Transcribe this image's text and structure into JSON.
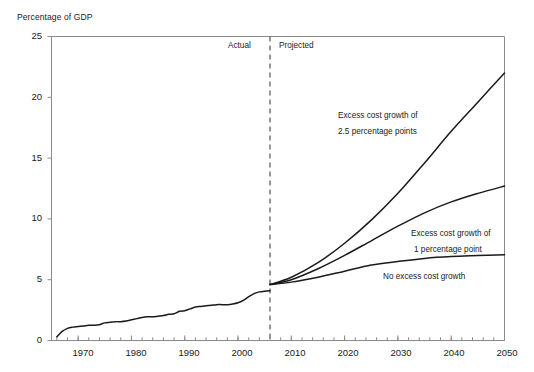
{
  "chart_data": {
    "type": "line",
    "title": "",
    "ylabel": "Percentage of GDP",
    "xlabel": "",
    "ylim": [
      0,
      25
    ],
    "xlim": [
      1965,
      2050
    ],
    "grid": false,
    "legend_position": "inline-annotations",
    "y_ticks": [
      0,
      5,
      10,
      15,
      20,
      25
    ],
    "x_ticks": [
      1970,
      1980,
      1990,
      2000,
      2010,
      2020,
      2030,
      2040,
      2050
    ],
    "x_minor_tick_step": 2,
    "divider": {
      "year": 2006,
      "style": "dashed",
      "left_label": "Actual",
      "right_label": "Projected"
    },
    "series": [
      {
        "name": "Excess cost growth of 2.5 percentage points",
        "annotation_lines": [
          "Excess cost growth of",
          "2.5 percentage points"
        ],
        "color": "#1a1a1a",
        "x": [
          2006,
          2010,
          2015,
          2020,
          2025,
          2030,
          2035,
          2040,
          2045,
          2050
        ],
        "values": [
          4.6,
          5.2,
          6.4,
          8.0,
          9.9,
          12.1,
          14.6,
          17.2,
          19.6,
          22.0
        ]
      },
      {
        "name": "Excess cost growth of 1 percentage point",
        "annotation_lines": [
          "Excess cost growth of",
          "1 percentage point"
        ],
        "color": "#1a1a1a",
        "x": [
          2006,
          2010,
          2015,
          2020,
          2025,
          2030,
          2035,
          2040,
          2045,
          2050
        ],
        "values": [
          4.6,
          5.0,
          5.9,
          7.0,
          8.2,
          9.4,
          10.5,
          11.4,
          12.1,
          12.7
        ]
      },
      {
        "name": "No excess cost growth",
        "annotation_lines": [
          "No excess cost growth"
        ],
        "color": "#1a1a1a",
        "x": [
          2006,
          2010,
          2015,
          2020,
          2025,
          2030,
          2035,
          2040,
          2045,
          2050
        ],
        "values": [
          4.6,
          4.8,
          5.2,
          5.7,
          6.2,
          6.5,
          6.75,
          6.9,
          6.98,
          7.05
        ]
      },
      {
        "name": "Actual historical spending",
        "annotation_lines": [],
        "color": "#1a1a1a",
        "x": [
          1966,
          1967,
          1968,
          1969,
          1970,
          1971,
          1972,
          1973,
          1974,
          1975,
          1976,
          1977,
          1978,
          1979,
          1980,
          1981,
          1982,
          1983,
          1984,
          1985,
          1986,
          1987,
          1988,
          1989,
          1990,
          1991,
          1992,
          1993,
          1994,
          1995,
          1996,
          1997,
          1998,
          1999,
          2000,
          2001,
          2002,
          2003,
          2004,
          2005,
          2006
        ],
        "values": [
          0.3,
          0.75,
          1.0,
          1.1,
          1.15,
          1.2,
          1.25,
          1.25,
          1.3,
          1.45,
          1.5,
          1.55,
          1.55,
          1.6,
          1.7,
          1.8,
          1.9,
          1.95,
          1.95,
          2.0,
          2.05,
          2.15,
          2.2,
          2.4,
          2.45,
          2.6,
          2.75,
          2.8,
          2.85,
          2.9,
          2.95,
          2.95,
          2.95,
          3.0,
          3.1,
          3.3,
          3.6,
          3.85,
          4.0,
          4.05,
          4.1
        ]
      }
    ]
  },
  "labels": {
    "y_axis_title": "Percentage of GDP",
    "y_0": "0",
    "y_5": "5",
    "y_10": "10",
    "y_15": "15",
    "y_20": "20",
    "y_25": "25",
    "x_1970": "1970",
    "x_1980": "1980",
    "x_1990": "1990",
    "x_2000": "2000",
    "x_2010": "2010",
    "x_2020": "2020",
    "x_2030": "2030",
    "x_2040": "2040",
    "x_2050": "2050",
    "actual": "Actual",
    "projected": "Projected",
    "annot_high_l1": "Excess cost growth of",
    "annot_high_l2": "2.5 percentage points",
    "annot_mid_l1": "Excess cost growth of",
    "annot_mid_l2": "1 percentage point",
    "annot_low_l1": "No excess cost growth"
  },
  "colors": {
    "line": "#1a1a1a",
    "frame": "#8a8a8a",
    "text": "#1a1a1a",
    "background": "#ffffff"
  }
}
